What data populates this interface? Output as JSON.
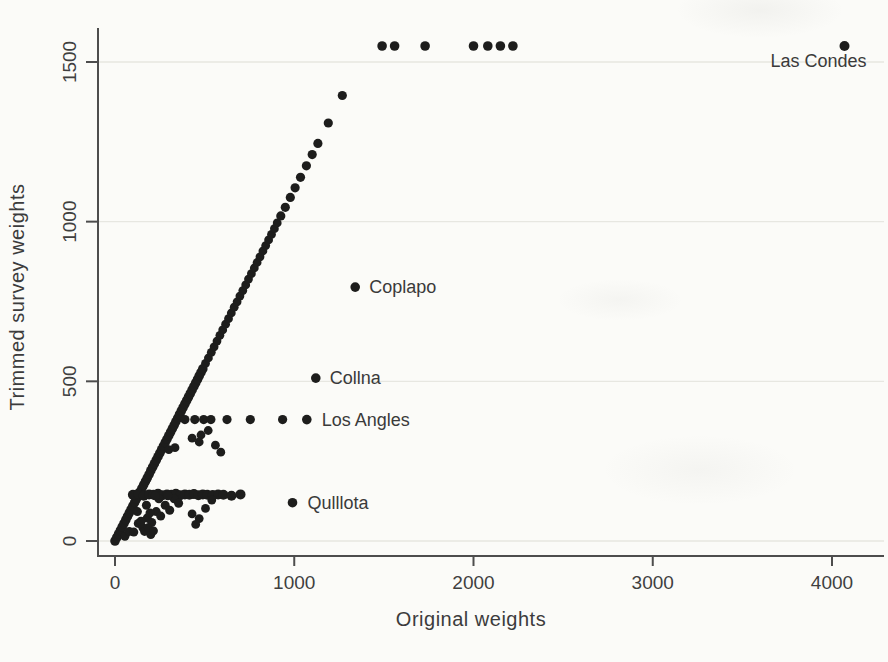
{
  "figure": {
    "background_color": "#fbfbf8",
    "point_color": "#1d1d1c",
    "axis_color": "#4d4d4d",
    "grid_color": "#e7e7e1",
    "text_color": "#3c3c3c"
  },
  "chart_data": {
    "type": "scatter",
    "title": "",
    "xlabel": "Original weights",
    "ylabel": "Trimmed survey weights",
    "xlim": [
      0,
      4300
    ],
    "ylim": [
      0,
      1620
    ],
    "x_ticks": [
      0,
      1000,
      2000,
      3000,
      4000
    ],
    "y_ticks": [
      0,
      500,
      1000,
      1500
    ],
    "grid": "horizontal",
    "legend": "none",
    "annotations": [
      {
        "label": "Las Condes",
        "x": 4070,
        "y": 1550,
        "anchor": "middle",
        "dx": -26,
        "dy": 21,
        "r": 5
      },
      {
        "label": "Coplapo",
        "x": 1340,
        "y": 795,
        "anchor": "start",
        "dx": 14,
        "dy": 6,
        "r": 4.8
      },
      {
        "label": "Collna",
        "x": 1120,
        "y": 510,
        "anchor": "start",
        "dx": 14,
        "dy": 6,
        "r": 4.8
      },
      {
        "label": "Los Angles",
        "x": 1070,
        "y": 380,
        "anchor": "start",
        "dx": 15,
        "dy": 6,
        "r": 4.8
      },
      {
        "label": "Qulllota",
        "x": 990,
        "y": 120,
        "anchor": "start",
        "dx": 15,
        "dy": 6,
        "r": 4.8
      }
    ],
    "series": [
      {
        "name": "diagonal-dense",
        "marker_r": 4.8,
        "points": [
          [
            0,
            0
          ],
          [
            10,
            11
          ],
          [
            20,
            22
          ],
          [
            30,
            33
          ],
          [
            40,
            44
          ],
          [
            50,
            55
          ],
          [
            60,
            66
          ],
          [
            70,
            77
          ],
          [
            80,
            88
          ],
          [
            90,
            99
          ],
          [
            100,
            110
          ],
          [
            110,
            121
          ],
          [
            120,
            132
          ],
          [
            130,
            143
          ],
          [
            140,
            154
          ],
          [
            150,
            165
          ],
          [
            160,
            176
          ],
          [
            170,
            187
          ],
          [
            180,
            198
          ],
          [
            190,
            209
          ],
          [
            200,
            220
          ],
          [
            210,
            231
          ],
          [
            220,
            242
          ],
          [
            230,
            253
          ],
          [
            240,
            264
          ],
          [
            250,
            275
          ],
          [
            260,
            286
          ],
          [
            270,
            297
          ],
          [
            280,
            308
          ],
          [
            290,
            319
          ],
          [
            300,
            330
          ],
          [
            310,
            341
          ],
          [
            320,
            352
          ],
          [
            330,
            363
          ],
          [
            340,
            374
          ],
          [
            350,
            385
          ],
          [
            360,
            396
          ],
          [
            370,
            407
          ],
          [
            380,
            418
          ],
          [
            390,
            429
          ],
          [
            400,
            440
          ],
          [
            410,
            451
          ],
          [
            420,
            462
          ],
          [
            430,
            473
          ],
          [
            440,
            484
          ],
          [
            450,
            495
          ],
          [
            460,
            506
          ],
          [
            470,
            517
          ],
          [
            480,
            528
          ],
          [
            490,
            539
          ]
        ]
      },
      {
        "name": "diagonal-mid",
        "marker_r": 4.4,
        "points": [
          [
            505,
            556
          ],
          [
            521,
            573
          ],
          [
            537,
            591
          ],
          [
            553,
            608
          ],
          [
            569,
            626
          ],
          [
            585,
            644
          ],
          [
            601,
            661
          ],
          [
            617,
            679
          ],
          [
            633,
            696
          ],
          [
            649,
            714
          ],
          [
            665,
            732
          ],
          [
            681,
            749
          ],
          [
            697,
            767
          ],
          [
            713,
            784
          ],
          [
            729,
            802
          ],
          [
            745,
            820
          ],
          [
            761,
            837
          ],
          [
            777,
            855
          ],
          [
            793,
            872
          ],
          [
            809,
            890
          ],
          [
            825,
            908
          ],
          [
            841,
            925
          ],
          [
            857,
            943
          ],
          [
            873,
            960
          ],
          [
            889,
            978
          ],
          [
            905,
            996
          ]
        ]
      },
      {
        "name": "diagonal-upper",
        "marker_r": 4.6,
        "points": [
          [
            925,
            1018
          ],
          [
            950,
            1045
          ],
          [
            978,
            1076
          ],
          [
            1005,
            1106
          ],
          [
            1035,
            1139
          ],
          [
            1068,
            1175
          ],
          [
            1100,
            1210
          ],
          [
            1132,
            1245
          ],
          [
            1190,
            1309
          ],
          [
            1268,
            1395
          ]
        ]
      },
      {
        "name": "ceiling-row-1550",
        "marker_r": 4.8,
        "points": [
          [
            1490,
            1550
          ],
          [
            1560,
            1550
          ],
          [
            1730,
            1550
          ],
          [
            2000,
            1550
          ],
          [
            2080,
            1550
          ],
          [
            2150,
            1550
          ],
          [
            2220,
            1550
          ]
        ]
      },
      {
        "name": "trim-band-380",
        "marker_r": 4.6,
        "points": [
          [
            390,
            380
          ],
          [
            445,
            380
          ],
          [
            495,
            380
          ],
          [
            535,
            380
          ],
          [
            625,
            380
          ],
          [
            755,
            380
          ],
          [
            935,
            380
          ]
        ]
      },
      {
        "name": "trim-band-145",
        "marker_r": 5,
        "points": [
          [
            100,
            145
          ],
          [
            130,
            148
          ],
          [
            160,
            142
          ],
          [
            190,
            146
          ],
          [
            215,
            145
          ],
          [
            240,
            148
          ],
          [
            265,
            143
          ],
          [
            290,
            146
          ],
          [
            315,
            145
          ],
          [
            340,
            148
          ],
          [
            365,
            143
          ],
          [
            390,
            146
          ],
          [
            415,
            145
          ],
          [
            440,
            147
          ],
          [
            465,
            143
          ],
          [
            490,
            146
          ],
          [
            515,
            145
          ],
          [
            545,
            144
          ],
          [
            575,
            146
          ],
          [
            605,
            145
          ],
          [
            650,
            142
          ],
          [
            700,
            146
          ]
        ]
      },
      {
        "name": "wedge-scatter",
        "marker_r": 4.5,
        "points": [
          [
            55,
            15
          ],
          [
            80,
            30
          ],
          [
            105,
            28
          ],
          [
            130,
            55
          ],
          [
            155,
            42
          ],
          [
            180,
            72
          ],
          [
            205,
            58
          ],
          [
            230,
            92
          ],
          [
            255,
            78
          ],
          [
            280,
            112
          ],
          [
            305,
            96
          ],
          [
            330,
            132
          ],
          [
            355,
            118
          ],
          [
            145,
            62
          ],
          [
            195,
            88
          ],
          [
            245,
            132
          ],
          [
            295,
            142
          ],
          [
            125,
            92
          ],
          [
            175,
            112
          ],
          [
            225,
            142
          ],
          [
            165,
            30
          ],
          [
            200,
            20
          ]
        ]
      },
      {
        "name": "below-band-scatter",
        "marker_r": 4.4,
        "points": [
          [
            480,
            332
          ],
          [
            520,
            346
          ],
          [
            560,
            300
          ],
          [
            300,
            286
          ],
          [
            335,
            292
          ],
          [
            590,
            278
          ],
          [
            430,
            322
          ],
          [
            470,
            310
          ]
        ]
      },
      {
        "name": "low-scatter",
        "marker_r": 4.4,
        "points": [
          [
            430,
            85
          ],
          [
            470,
            70
          ],
          [
            450,
            52
          ],
          [
            185,
            42
          ],
          [
            215,
            32
          ],
          [
            505,
            102
          ],
          [
            540,
            128
          ]
        ]
      }
    ]
  }
}
